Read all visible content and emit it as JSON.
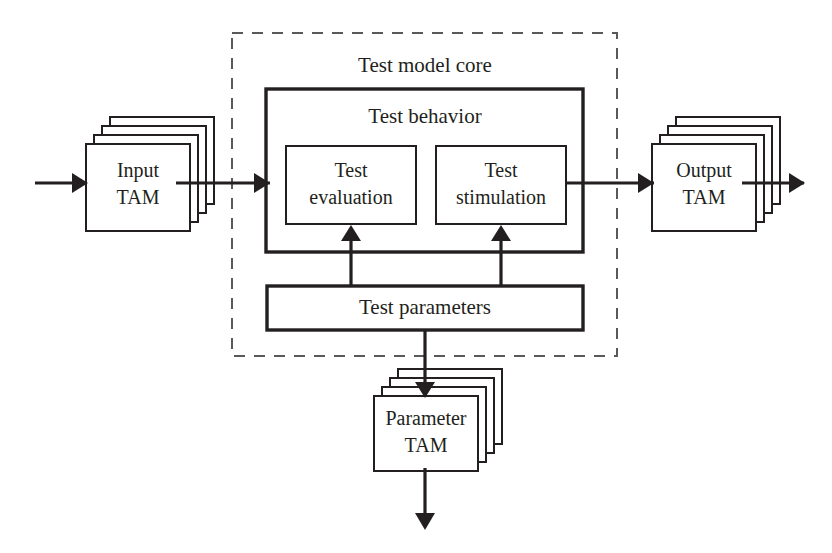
{
  "diagram": {
    "type": "block-diagram",
    "background_color": "#ffffff",
    "line_color": "#231f20",
    "dashed_line_color": "#5a585a",
    "containers": {
      "core": {
        "label": "Test model core",
        "style": "dashed-rectangle"
      },
      "behavior": {
        "label": "Test behavior",
        "style": "solid-thick-rectangle"
      }
    },
    "blocks": [
      {
        "id": "input-tam",
        "label_line1": "Input",
        "label_line2": "TAM",
        "style": "stacked-box",
        "stack_count": 4
      },
      {
        "id": "test-evaluation",
        "label_line1": "Test",
        "label_line2": "evaluation",
        "style": "solid-rectangle"
      },
      {
        "id": "test-stimulation",
        "label_line1": "Test",
        "label_line2": "stimulation",
        "style": "solid-rectangle"
      },
      {
        "id": "output-tam",
        "label_line1": "Output",
        "label_line2": "TAM",
        "style": "stacked-box",
        "stack_count": 4
      },
      {
        "id": "test-parameters",
        "label_line1": "Test parameters",
        "label_line2": "",
        "style": "solid-thick-rectangle"
      },
      {
        "id": "parameter-tam",
        "label_line1": "Parameter",
        "label_line2": "TAM",
        "style": "stacked-box",
        "stack_count": 4
      }
    ],
    "connections": [
      {
        "id": "external-in-to-input-tam",
        "from": "external-input",
        "to": "input-tam",
        "direction": "right"
      },
      {
        "id": "input-tam-to-behavior",
        "from": "input-tam",
        "to": "test-behavior",
        "direction": "right"
      },
      {
        "id": "behavior-to-output-tam",
        "from": "test-behavior",
        "to": "output-tam",
        "direction": "right"
      },
      {
        "id": "output-tam-to-external-out",
        "from": "output-tam",
        "to": "external-output",
        "direction": "right"
      },
      {
        "id": "parameters-to-evaluation",
        "from": "test-parameters",
        "to": "test-evaluation",
        "direction": "up"
      },
      {
        "id": "parameters-to-stimulation",
        "from": "test-parameters",
        "to": "test-stimulation",
        "direction": "up"
      },
      {
        "id": "parameters-to-parameter-tam",
        "from": "test-parameters",
        "to": "parameter-tam",
        "direction": "down"
      },
      {
        "id": "parameter-tam-to-external-down",
        "from": "parameter-tam",
        "to": "external-output-down",
        "direction": "down"
      }
    ]
  }
}
